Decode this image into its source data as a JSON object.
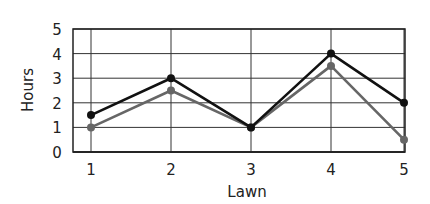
{
  "chart_data": {
    "type": "line",
    "title": "",
    "xlabel": "Lawn",
    "ylabel": "Hours",
    "categories": [
      "1",
      "2",
      "3",
      "4",
      "5"
    ],
    "x": [
      1,
      2,
      3,
      4,
      5
    ],
    "series": [
      {
        "name": "Series A (black)",
        "color": "#111111",
        "values": [
          1.5,
          3,
          1,
          4,
          2
        ]
      },
      {
        "name": "Series B (gray)",
        "color": "#666666",
        "values": [
          1,
          2.5,
          1,
          3.5,
          0.5
        ]
      }
    ],
    "ylim": [
      0,
      5
    ],
    "yticks": [
      "0",
      "1",
      "2",
      "3",
      "4",
      "5"
    ],
    "grid": true,
    "legend": "none"
  }
}
